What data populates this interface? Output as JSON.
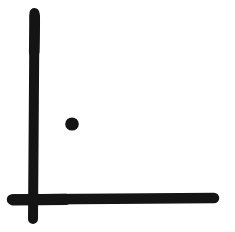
{
  "canvas": {
    "width": 235,
    "height": 232,
    "background_color": "#ffffff",
    "ink_color": "#141414"
  },
  "figure": {
    "name": "hand-drawn-axis-glyph",
    "style": "ink-brush",
    "element_count": 3
  },
  "chart_data": {
    "type": "scatter",
    "title": "",
    "subtitle": "",
    "xlabel": "",
    "ylabel": "",
    "grid": false,
    "legend": null,
    "axis_style": "hand-drawn-ink",
    "xlim": [
      0,
      235
    ],
    "ylim": [
      232,
      0
    ],
    "axes": [
      {
        "name": "y-axis-stroke",
        "orientation": "vertical",
        "x1": 34.5,
        "y1": 13,
        "x2": 33.0,
        "y2": 219,
        "thickness": 10,
        "color": "#141414",
        "cap": "round"
      },
      {
        "name": "x-axis-stroke",
        "orientation": "horizontal",
        "x1": 12,
        "y1": 199.5,
        "x2": 214,
        "y2": 198.0,
        "thickness": 10.5,
        "color": "#141414",
        "cap": "round"
      }
    ],
    "points": [
      {
        "name": "ink-dot",
        "cx": 72,
        "cy": 124,
        "r": 6.8,
        "color": "#141414"
      }
    ],
    "annotations": []
  }
}
